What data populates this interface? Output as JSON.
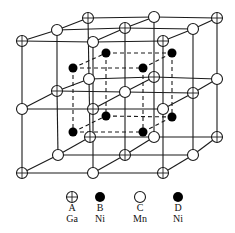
{
  "diagram": {
    "colors": {
      "line": "#1a1a1a",
      "atom_fill_open": "#ffffff",
      "atom_fill_solid": "#000000"
    },
    "atom_radius": 5.5,
    "solid_radius": 4.5,
    "lattice_nodes": [
      {
        "x": 22,
        "y": 41,
        "type": "A"
      },
      {
        "x": 57,
        "y": 30,
        "type": "C"
      },
      {
        "x": 88,
        "y": 18,
        "type": "A"
      },
      {
        "x": 93,
        "y": 42,
        "type": "C"
      },
      {
        "x": 125,
        "y": 28,
        "type": "A"
      },
      {
        "x": 154,
        "y": 17,
        "type": "C"
      },
      {
        "x": 163,
        "y": 41,
        "type": "A"
      },
      {
        "x": 193,
        "y": 29,
        "type": "C"
      },
      {
        "x": 217,
        "y": 18,
        "type": "A"
      },
      {
        "x": 22,
        "y": 109,
        "type": "C"
      },
      {
        "x": 57,
        "y": 91,
        "type": "A"
      },
      {
        "x": 89,
        "y": 79,
        "type": "C"
      },
      {
        "x": 93,
        "y": 109,
        "type": "A"
      },
      {
        "x": 125,
        "y": 92,
        "type": "C"
      },
      {
        "x": 154,
        "y": 77,
        "type": "A"
      },
      {
        "x": 163,
        "y": 109,
        "type": "C"
      },
      {
        "x": 193,
        "y": 93,
        "type": "A"
      },
      {
        "x": 217,
        "y": 79,
        "type": "C"
      },
      {
        "x": 22,
        "y": 173,
        "type": "A"
      },
      {
        "x": 58,
        "y": 155,
        "type": "C"
      },
      {
        "x": 90,
        "y": 137,
        "type": "A"
      },
      {
        "x": 93,
        "y": 173,
        "type": "C"
      },
      {
        "x": 125,
        "y": 155,
        "type": "A"
      },
      {
        "x": 154,
        "y": 137,
        "type": "C"
      },
      {
        "x": 163,
        "y": 173,
        "type": "A"
      },
      {
        "x": 193,
        "y": 155,
        "type": "C"
      },
      {
        "x": 217,
        "y": 137,
        "type": "A"
      }
    ],
    "ni_atoms": [
      {
        "x": 73,
        "y": 68
      },
      {
        "x": 106,
        "y": 53
      },
      {
        "x": 143,
        "y": 68
      },
      {
        "x": 172,
        "y": 53
      },
      {
        "x": 73,
        "y": 132
      },
      {
        "x": 106,
        "y": 116
      },
      {
        "x": 143,
        "y": 132
      },
      {
        "x": 172,
        "y": 117
      }
    ],
    "legend": [
      {
        "symbol": "A",
        "element": "Ga",
        "style": "cross",
        "x": 72
      },
      {
        "symbol": "B",
        "element": "Ni",
        "style": "solid",
        "x": 100
      },
      {
        "symbol": "C",
        "element": "Mn",
        "style": "open",
        "x": 140
      },
      {
        "symbol": "D",
        "element": "Ni",
        "style": "solid",
        "x": 178
      }
    ],
    "legend_y": {
      "marker": 197,
      "symbol": 211,
      "element": 222
    }
  }
}
